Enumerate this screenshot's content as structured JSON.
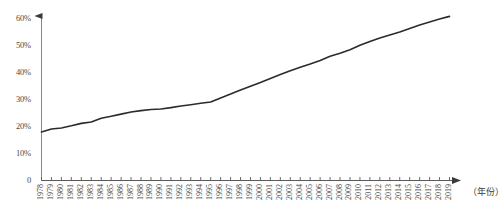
{
  "chart_data": {
    "type": "line",
    "title": "",
    "subtitle": "",
    "xlabel": "（年份）",
    "ylabel": "",
    "grid": false,
    "legend": false,
    "xlim": [
      1978,
      2019
    ],
    "ylim": [
      0,
      60
    ],
    "y_ticks": [
      "0",
      "10%",
      "20%",
      "30%",
      "40%",
      "50%",
      "60%"
    ],
    "y_tick_values": [
      0,
      10,
      20,
      30,
      40,
      50,
      60
    ],
    "categories": [
      "1978",
      "1979",
      "1980",
      "1981",
      "1982",
      "1983",
      "1984",
      "1985",
      "1986",
      "1987",
      "1988",
      "1989",
      "1990",
      "1991",
      "1992",
      "1993",
      "1994",
      "1995",
      "1996",
      "1997",
      "1998",
      "1999",
      "2000",
      "2001",
      "2002",
      "2003",
      "2004",
      "2005",
      "2006",
      "2007",
      "2008",
      "2009",
      "2010",
      "2011",
      "2012",
      "2013",
      "2014",
      "2015",
      "2016",
      "2017",
      "2018",
      "2019"
    ],
    "series": [
      {
        "name": "城镇化率",
        "color": "#2b2b2b",
        "values": [
          17.9,
          19.0,
          19.4,
          20.2,
          21.1,
          21.6,
          23.0,
          23.7,
          24.5,
          25.3,
          25.8,
          26.2,
          26.4,
          26.9,
          27.5,
          28.0,
          28.5,
          29.0,
          30.5,
          31.9,
          33.4,
          34.8,
          36.2,
          37.7,
          39.1,
          40.5,
          41.8,
          43.0,
          44.3,
          45.9,
          47.0,
          48.3,
          49.9,
          51.3,
          52.6,
          53.7,
          54.8,
          56.1,
          57.4,
          58.5,
          59.6,
          60.6
        ]
      }
    ]
  },
  "axes": {
    "y_arrow": "up-arrow",
    "x_arrow": "right-arrow"
  }
}
